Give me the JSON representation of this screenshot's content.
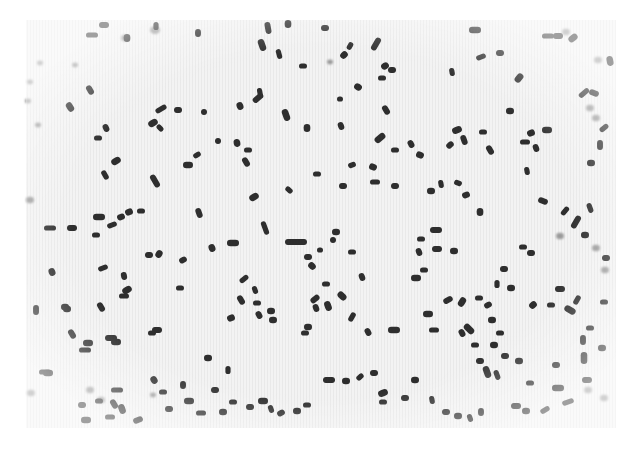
{
  "image": {
    "description": "Light micrograph of scattered rod-shaped bacteria (bacilli), stained dark on a pale background",
    "width": 631,
    "height": 449,
    "field": {
      "x": 26,
      "y": 20,
      "width": 590,
      "height": 408,
      "fill": "#f1f1f1"
    },
    "colors": {
      "background": "#ffffff",
      "field": "#f1f1f1",
      "cell": "#2e2e2e",
      "cell_faint": "#9a9a9a"
    },
    "rods": [
      [
        92,
        35,
        6,
        0
      ],
      [
        104,
        25,
        5,
        0
      ],
      [
        127,
        38,
        4,
        90
      ],
      [
        156,
        26,
        4,
        90
      ],
      [
        198,
        33,
        4,
        90
      ],
      [
        262,
        45,
        6,
        70
      ],
      [
        279,
        54,
        5,
        75
      ],
      [
        268,
        28,
        6,
        80
      ],
      [
        288,
        24,
        4,
        90
      ],
      [
        303,
        66,
        4,
        0
      ],
      [
        90,
        90,
        5,
        60
      ],
      [
        70,
        107,
        5,
        60
      ],
      [
        161,
        109,
        6,
        -30
      ],
      [
        178,
        110,
        4,
        0
      ],
      [
        153,
        123,
        5,
        -30
      ],
      [
        160,
        128,
        4,
        45
      ],
      [
        204,
        112,
        3,
        0
      ],
      [
        240,
        106,
        4,
        70
      ],
      [
        260,
        93,
        5,
        80
      ],
      [
        258,
        98,
        6,
        -40
      ],
      [
        286,
        115,
        6,
        70
      ],
      [
        98,
        138,
        4,
        0
      ],
      [
        106,
        128,
        4,
        65
      ],
      [
        116,
        161,
        5,
        -30
      ],
      [
        105,
        175,
        5,
        60
      ],
      [
        155,
        181,
        7,
        60
      ],
      [
        188,
        165,
        5,
        0
      ],
      [
        197,
        155,
        4,
        -30
      ],
      [
        218,
        141,
        3,
        0
      ],
      [
        237,
        143,
        4,
        80
      ],
      [
        248,
        150,
        4,
        0
      ],
      [
        246,
        162,
        5,
        60
      ],
      [
        254,
        197,
        5,
        -30
      ],
      [
        289,
        190,
        4,
        40
      ],
      [
        325,
        28,
        4,
        0
      ],
      [
        344,
        55,
        4,
        -45
      ],
      [
        350,
        46,
        4,
        -60
      ],
      [
        376,
        44,
        7,
        -60
      ],
      [
        385,
        66,
        4,
        -30
      ],
      [
        382,
        78,
        4,
        0
      ],
      [
        392,
        70,
        4,
        0
      ],
      [
        358,
        87,
        4,
        30
      ],
      [
        340,
        99,
        3,
        0
      ],
      [
        341,
        126,
        4,
        70
      ],
      [
        307,
        128,
        4,
        90
      ],
      [
        317,
        174,
        4,
        0
      ],
      [
        386,
        110,
        5,
        60
      ],
      [
        380,
        138,
        6,
        -40
      ],
      [
        395,
        150,
        4,
        0
      ],
      [
        411,
        144,
        4,
        60
      ],
      [
        420,
        155,
        4,
        20
      ],
      [
        352,
        165,
        4,
        -20
      ],
      [
        343,
        186,
        4,
        0
      ],
      [
        373,
        167,
        4,
        20
      ],
      [
        375,
        182,
        5,
        0
      ],
      [
        395,
        186,
        4,
        0
      ],
      [
        475,
        30,
        6,
        0
      ],
      [
        481,
        57,
        5,
        -20
      ],
      [
        500,
        53,
        4,
        0
      ],
      [
        519,
        78,
        5,
        -50
      ],
      [
        452,
        72,
        4,
        80
      ],
      [
        464,
        140,
        5,
        70
      ],
      [
        457,
        130,
        5,
        -20
      ],
      [
        483,
        132,
        4,
        0
      ],
      [
        490,
        150,
        5,
        60
      ],
      [
        531,
        133,
        4,
        -20
      ],
      [
        525,
        142,
        5,
        0
      ],
      [
        536,
        148,
        4,
        70
      ],
      [
        547,
        130,
        5,
        0
      ],
      [
        527,
        171,
        4,
        80
      ],
      [
        543,
        201,
        5,
        20
      ],
      [
        510,
        111,
        4,
        0
      ],
      [
        548,
        36,
        6,
        0
      ],
      [
        558,
        36,
        5,
        0
      ],
      [
        573,
        38,
        5,
        -40
      ],
      [
        584,
        93,
        6,
        -40
      ],
      [
        594,
        93,
        5,
        20
      ],
      [
        610,
        61,
        5,
        80
      ],
      [
        604,
        128,
        5,
        -40
      ],
      [
        600,
        145,
        5,
        90
      ],
      [
        591,
        163,
        4,
        0
      ],
      [
        590,
        208,
        5,
        70
      ],
      [
        436,
        230,
        6,
        0
      ],
      [
        454,
        251,
        4,
        0
      ],
      [
        441,
        184,
        4,
        80
      ],
      [
        450,
        145,
        4,
        -40
      ],
      [
        431,
        191,
        4,
        0
      ],
      [
        458,
        183,
        4,
        20
      ],
      [
        466,
        195,
        4,
        -20
      ],
      [
        480,
        212,
        4,
        90
      ],
      [
        565,
        211,
        5,
        -50
      ],
      [
        576,
        222,
        7,
        -60
      ],
      [
        585,
        235,
        4,
        0
      ],
      [
        50,
        228,
        6,
        0
      ],
      [
        72,
        228,
        5,
        0
      ],
      [
        99,
        217,
        6,
        0
      ],
      [
        112,
        225,
        5,
        -20
      ],
      [
        121,
        217,
        4,
        -20
      ],
      [
        129,
        212,
        4,
        -20
      ],
      [
        141,
        211,
        4,
        0
      ],
      [
        199,
        213,
        5,
        70
      ],
      [
        233,
        243,
        6,
        0
      ],
      [
        265,
        228,
        7,
        70
      ],
      [
        296,
        242,
        11,
        0
      ],
      [
        52,
        272,
        4,
        70
      ],
      [
        103,
        268,
        5,
        -20
      ],
      [
        124,
        276,
        4,
        80
      ],
      [
        127,
        290,
        5,
        -30
      ],
      [
        124,
        296,
        5,
        0
      ],
      [
        101,
        307,
        5,
        60
      ],
      [
        67,
        309,
        4,
        0
      ],
      [
        96,
        235,
        4,
        0
      ],
      [
        149,
        255,
        4,
        0
      ],
      [
        159,
        254,
        4,
        -60
      ],
      [
        180,
        288,
        4,
        0
      ],
      [
        183,
        260,
        4,
        -30
      ],
      [
        212,
        248,
        4,
        70
      ],
      [
        244,
        279,
        5,
        -40
      ],
      [
        241,
        300,
        5,
        60
      ],
      [
        231,
        318,
        4,
        -20
      ],
      [
        255,
        290,
        4,
        70
      ],
      [
        259,
        315,
        4,
        60
      ],
      [
        271,
        311,
        4,
        0
      ],
      [
        257,
        303,
        4,
        0
      ],
      [
        308,
        257,
        4,
        0
      ],
      [
        312,
        266,
        4,
        45
      ],
      [
        320,
        250,
        3,
        0
      ],
      [
        333,
        240,
        3,
        0
      ],
      [
        336,
        232,
        4,
        0
      ],
      [
        326,
        284,
        4,
        0
      ],
      [
        316,
        308,
        4,
        70
      ],
      [
        308,
        327,
        4,
        0
      ],
      [
        305,
        333,
        4,
        0
      ],
      [
        315,
        299,
        5,
        -40
      ],
      [
        328,
        306,
        5,
        70
      ],
      [
        352,
        252,
        4,
        0
      ],
      [
        362,
        277,
        4,
        70
      ],
      [
        342,
        296,
        5,
        45
      ],
      [
        352,
        317,
        5,
        -60
      ],
      [
        368,
        332,
        4,
        60
      ],
      [
        394,
        330,
        6,
        0
      ],
      [
        421,
        239,
        4,
        0
      ],
      [
        419,
        252,
        4,
        70
      ],
      [
        416,
        278,
        5,
        0
      ],
      [
        424,
        270,
        4,
        0
      ],
      [
        437,
        249,
        5,
        0
      ],
      [
        428,
        314,
        5,
        0
      ],
      [
        434,
        330,
        5,
        0
      ],
      [
        448,
        300,
        5,
        -30
      ],
      [
        462,
        302,
        5,
        -60
      ],
      [
        479,
        298,
        4,
        0
      ],
      [
        462,
        333,
        4,
        60
      ],
      [
        469,
        329,
        6,
        45
      ],
      [
        475,
        345,
        4,
        0
      ],
      [
        480,
        361,
        4,
        0
      ],
      [
        494,
        345,
        4,
        0
      ],
      [
        500,
        333,
        4,
        0
      ],
      [
        488,
        305,
        4,
        -30
      ],
      [
        492,
        320,
        4,
        0
      ],
      [
        497,
        284,
        4,
        90
      ],
      [
        504,
        269,
        4,
        0
      ],
      [
        511,
        288,
        4,
        0
      ],
      [
        523,
        247,
        4,
        0
      ],
      [
        531,
        253,
        4,
        0
      ],
      [
        533,
        305,
        4,
        -40
      ],
      [
        551,
        305,
        4,
        0
      ],
      [
        560,
        289,
        5,
        0
      ],
      [
        570,
        310,
        6,
        30
      ],
      [
        577,
        300,
        5,
        -60
      ],
      [
        583,
        340,
        5,
        90
      ],
      [
        584,
        358,
        6,
        90
      ],
      [
        590,
        328,
        4,
        0
      ],
      [
        556,
        365,
        4,
        0
      ],
      [
        558,
        388,
        6,
        0
      ],
      [
        568,
        402,
        6,
        -20
      ],
      [
        587,
        380,
        5,
        0
      ],
      [
        602,
        348,
        4,
        0
      ],
      [
        604,
        302,
        4,
        0
      ],
      [
        606,
        258,
        4,
        0
      ],
      [
        346,
        381,
        4,
        0
      ],
      [
        360,
        377,
        4,
        -40
      ],
      [
        374,
        373,
        4,
        0
      ],
      [
        383,
        393,
        5,
        -20
      ],
      [
        383,
        402,
        4,
        0
      ],
      [
        405,
        398,
        4,
        0
      ],
      [
        415,
        380,
        4,
        0
      ],
      [
        432,
        400,
        4,
        80
      ],
      [
        446,
        412,
        4,
        0
      ],
      [
        458,
        416,
        4,
        0
      ],
      [
        470,
        418,
        4,
        70
      ],
      [
        481,
        412,
        4,
        90
      ],
      [
        487,
        372,
        6,
        70
      ],
      [
        497,
        375,
        5,
        70
      ],
      [
        505,
        356,
        4,
        0
      ],
      [
        519,
        361,
        4,
        0
      ],
      [
        530,
        383,
        4,
        0
      ],
      [
        516,
        406,
        5,
        0
      ],
      [
        526,
        411,
        4,
        0
      ],
      [
        545,
        410,
        5,
        -30
      ],
      [
        72,
        334,
        5,
        60
      ],
      [
        88,
        343,
        5,
        0
      ],
      [
        85,
        350,
        6,
        0
      ],
      [
        111,
        338,
        6,
        0
      ],
      [
        116,
        342,
        5,
        0
      ],
      [
        152,
        333,
        4,
        0
      ],
      [
        157,
        330,
        5,
        0
      ],
      [
        48,
        373,
        5,
        0
      ],
      [
        45,
        372,
        6,
        0
      ],
      [
        36,
        310,
        5,
        90
      ],
      [
        65,
        307,
        4,
        0
      ],
      [
        117,
        390,
        6,
        0
      ],
      [
        114,
        404,
        5,
        60
      ],
      [
        122,
        409,
        5,
        70
      ],
      [
        99,
        401,
        4,
        0
      ],
      [
        82,
        405,
        4,
        0
      ],
      [
        86,
        420,
        5,
        0
      ],
      [
        110,
        417,
        5,
        0
      ],
      [
        138,
        420,
        5,
        -20
      ],
      [
        154,
        380,
        4,
        60
      ],
      [
        163,
        392,
        4,
        0
      ],
      [
        169,
        409,
        4,
        0
      ],
      [
        189,
        401,
        5,
        0
      ],
      [
        201,
        413,
        5,
        0
      ],
      [
        215,
        390,
        4,
        0
      ],
      [
        223,
        412,
        4,
        0
      ],
      [
        233,
        402,
        4,
        0
      ],
      [
        250,
        407,
        4,
        0
      ],
      [
        263,
        401,
        5,
        0
      ],
      [
        271,
        409,
        4,
        70
      ],
      [
        281,
        413,
        4,
        -30
      ],
      [
        297,
        411,
        4,
        0
      ],
      [
        307,
        405,
        4,
        0
      ],
      [
        329,
        380,
        6,
        0
      ],
      [
        208,
        358,
        4,
        0
      ],
      [
        228,
        370,
        4,
        90
      ],
      [
        183,
        385,
        4,
        90
      ],
      [
        273,
        320,
        4,
        0
      ]
    ],
    "faint_spots": [
      [
        155,
        30,
        5
      ],
      [
        125,
        38,
        4
      ],
      [
        40,
        63,
        3
      ],
      [
        75,
        65,
        3
      ],
      [
        30,
        82,
        3
      ],
      [
        28,
        101,
        3
      ],
      [
        38,
        125,
        3
      ],
      [
        30,
        200,
        4
      ],
      [
        31,
        393,
        4
      ],
      [
        90,
        390,
        4
      ],
      [
        101,
        400,
        4
      ],
      [
        153,
        395,
        3
      ],
      [
        330,
        62,
        3
      ],
      [
        566,
        32,
        4
      ],
      [
        598,
        60,
        4
      ],
      [
        590,
        108,
        4
      ],
      [
        596,
        118,
        4
      ],
      [
        560,
        236,
        4
      ],
      [
        596,
        248,
        4
      ],
      [
        605,
        270,
        4
      ],
      [
        588,
        390,
        4
      ],
      [
        604,
        398,
        4
      ]
    ]
  }
}
